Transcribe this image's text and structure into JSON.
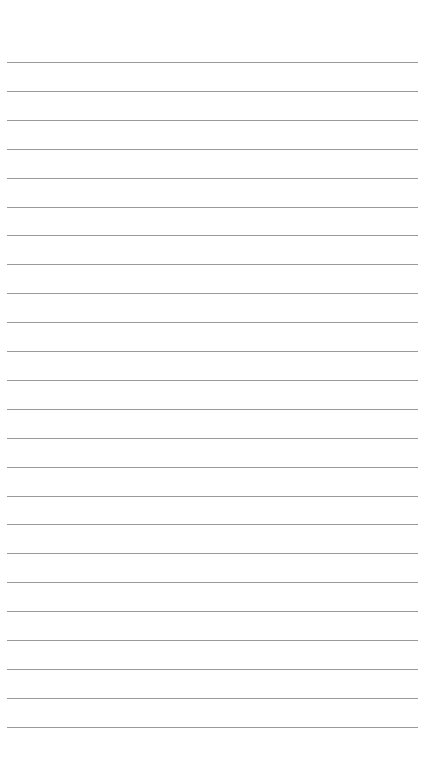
{
  "page": {
    "type": "lined-notepad",
    "background_color": "#ffffff",
    "rule_color": "#9a9a9a",
    "rule_count": 24,
    "rule_start_y": 62,
    "rule_spacing": 28.9,
    "rule_left_x": 7,
    "rule_width": 411,
    "lines": [
      "",
      "",
      "",
      "",
      "",
      "",
      "",
      "",
      "",
      "",
      "",
      "",
      "",
      "",
      "",
      "",
      "",
      "",
      "",
      "",
      "",
      "",
      "",
      ""
    ]
  }
}
